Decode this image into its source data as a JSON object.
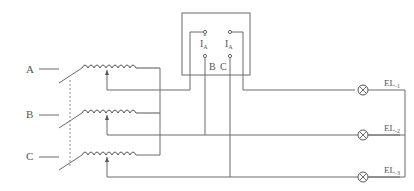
{
  "diagram": {
    "phases": [
      {
        "label": "A",
        "y": 69
      },
      {
        "label": "B",
        "y": 114
      },
      {
        "label": "C",
        "y": 156
      }
    ],
    "meter": {
      "terminals_top": [
        {
          "label": "I",
          "sub": "A",
          "star": "*"
        },
        {
          "label": "I",
          "sub": "A",
          "star": ""
        }
      ],
      "terminals_bottom": [
        {
          "label": "B"
        },
        {
          "label": "C"
        }
      ]
    },
    "lamps": [
      {
        "label": "EL",
        "sub": "-1"
      },
      {
        "label": "EL",
        "sub": "-2"
      },
      {
        "label": "EL",
        "sub": "-3"
      }
    ],
    "colors": {
      "line": "#6a6a6a",
      "text": "#555555",
      "background": "#ffffff"
    }
  }
}
